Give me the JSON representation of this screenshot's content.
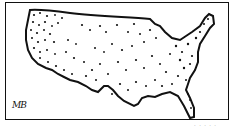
{
  "cartoon": {
    "subject": "Outline map of the contiguous United States filled with scattered dots",
    "signature": "MB",
    "caption": "· · · · ·"
  },
  "colors": {
    "ink": "#111111",
    "background": "#ffffff"
  }
}
